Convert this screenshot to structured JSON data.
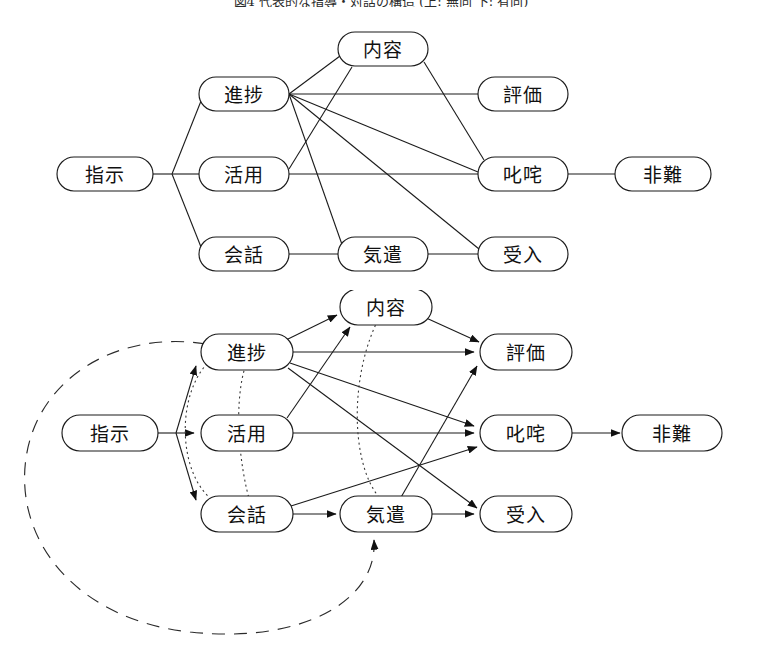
{
  "caption": {
    "text": "図4  代表的な指導・対話の構造 (上: 無向 下: 有向)"
  },
  "colors": {
    "stroke": "#1b1b1b",
    "text": "#111111",
    "background": "#ffffff",
    "dotted": "#3a3a3a"
  },
  "diagrams": [
    {
      "id": "undirected-graph",
      "name": "top-undirected-diagram",
      "directed": false,
      "nodes": [
        {
          "id": "shiji",
          "label": "指示",
          "x": 105,
          "y": 174,
          "rx": 48,
          "ry": 17
        },
        {
          "id": "shinchoku",
          "label": "進捗",
          "x": 244,
          "y": 94,
          "rx": 45,
          "ry": 17
        },
        {
          "id": "katsuyou",
          "label": "活用",
          "x": 244,
          "y": 174,
          "rx": 45,
          "ry": 17
        },
        {
          "id": "kaiwa",
          "label": "会話",
          "x": 244,
          "y": 254,
          "rx": 45,
          "ry": 17
        },
        {
          "id": "naiyou",
          "label": "内容",
          "x": 383,
          "y": 49,
          "rx": 45,
          "ry": 17
        },
        {
          "id": "kizukai",
          "label": "気遣",
          "x": 383,
          "y": 254,
          "rx": 45,
          "ry": 17
        },
        {
          "id": "hyouka",
          "label": "評価",
          "x": 523,
          "y": 94,
          "rx": 45,
          "ry": 17
        },
        {
          "id": "shitta",
          "label": "叱咤",
          "x": 523,
          "y": 174,
          "rx": 45,
          "ry": 17
        },
        {
          "id": "ukeire",
          "label": "受入",
          "x": 523,
          "y": 254,
          "rx": 45,
          "ry": 17
        },
        {
          "id": "hinan",
          "label": "非難",
          "x": 663,
          "y": 174,
          "rx": 48,
          "ry": 17
        }
      ],
      "edges": [
        {
          "from": "shiji",
          "to": "shinchoku"
        },
        {
          "from": "shiji",
          "to": "katsuyou"
        },
        {
          "from": "shiji",
          "to": "kaiwa"
        },
        {
          "from": "shinchoku",
          "to": "naiyou"
        },
        {
          "from": "shinchoku",
          "to": "hyouka"
        },
        {
          "from": "shinchoku",
          "to": "shitta"
        },
        {
          "from": "shinchoku",
          "to": "ukeire"
        },
        {
          "from": "katsuyou",
          "to": "naiyou"
        },
        {
          "from": "katsuyou",
          "to": "shitta"
        },
        {
          "from": "kaiwa",
          "to": "kizukai"
        },
        {
          "from": "kizukai",
          "to": "ukeire"
        },
        {
          "from": "kizukai",
          "to": "shinchoku"
        },
        {
          "from": "naiyou",
          "to": "shitta"
        },
        {
          "from": "shitta",
          "to": "hinan"
        }
      ]
    },
    {
      "id": "directed-graph",
      "name": "bottom-directed-diagram",
      "directed": true,
      "nodes": [
        {
          "id": "shiji",
          "label": "指示",
          "x": 110,
          "y": 433,
          "rx": 48,
          "ry": 18
        },
        {
          "id": "shinchoku",
          "label": "進捗",
          "x": 247,
          "y": 352,
          "rx": 46,
          "ry": 18
        },
        {
          "id": "katsuyou",
          "label": "活用",
          "x": 247,
          "y": 433,
          "rx": 46,
          "ry": 18
        },
        {
          "id": "kaiwa",
          "label": "会話",
          "x": 247,
          "y": 514,
          "rx": 46,
          "ry": 18
        },
        {
          "id": "naiyou",
          "label": "内容",
          "x": 386,
          "y": 307,
          "rx": 46,
          "ry": 18
        },
        {
          "id": "kizukai",
          "label": "気遣",
          "x": 386,
          "y": 514,
          "rx": 46,
          "ry": 18
        },
        {
          "id": "hyouka",
          "label": "評価",
          "x": 526,
          "y": 352,
          "rx": 46,
          "ry": 18
        },
        {
          "id": "shitta",
          "label": "叱咤",
          "x": 526,
          "y": 433,
          "rx": 46,
          "ry": 18
        },
        {
          "id": "ukeire",
          "label": "受入",
          "x": 526,
          "y": 514,
          "rx": 46,
          "ry": 18
        },
        {
          "id": "hinan",
          "label": "非難",
          "x": 672,
          "y": 433,
          "rx": 50,
          "ry": 18
        }
      ],
      "edges": [
        {
          "from": "shiji",
          "to": "shinchoku",
          "style": "solid"
        },
        {
          "from": "shiji",
          "to": "katsuyou",
          "style": "solid"
        },
        {
          "from": "shiji",
          "to": "kaiwa",
          "style": "solid"
        },
        {
          "from": "shinchoku",
          "to": "naiyou",
          "style": "solid"
        },
        {
          "from": "shinchoku",
          "to": "hyouka",
          "style": "solid"
        },
        {
          "from": "shinchoku",
          "to": "shitta",
          "style": "solid"
        },
        {
          "from": "shinchoku",
          "to": "ukeire",
          "style": "solid"
        },
        {
          "from": "katsuyou",
          "to": "naiyou",
          "style": "solid"
        },
        {
          "from": "katsuyou",
          "to": "shitta",
          "style": "solid"
        },
        {
          "from": "kaiwa",
          "to": "kizukai",
          "style": "solid"
        },
        {
          "from": "kaiwa",
          "to": "shitta",
          "style": "solid"
        },
        {
          "from": "kizukai",
          "to": "ukeire",
          "style": "solid"
        },
        {
          "from": "kizukai",
          "to": "hyouka",
          "style": "solid"
        },
        {
          "from": "naiyou",
          "to": "hyouka",
          "style": "solid"
        },
        {
          "from": "shitta",
          "to": "hinan",
          "style": "solid"
        },
        {
          "from": "shinchoku",
          "to": "kaiwa",
          "style": "dotted-curve",
          "note": "inner dotted arc"
        },
        {
          "from": "shinchoku",
          "to": "kaiwa",
          "style": "dotted-curve",
          "note": "outer dotted arc"
        },
        {
          "from": "naiyou",
          "to": "kizukai",
          "style": "dotted-curve",
          "note": "long dotted arc"
        },
        {
          "from": "shinchoku",
          "to": "kizukai",
          "style": "dashed-loop",
          "note": "large dashed feedback ellipse"
        }
      ]
    }
  ]
}
